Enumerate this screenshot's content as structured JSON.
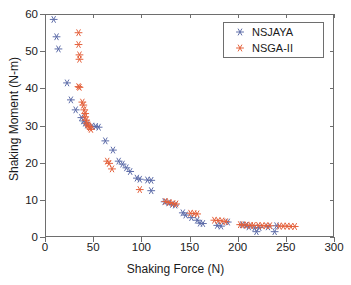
{
  "chart_data": {
    "type": "scatter",
    "title": "",
    "xlabel": "Shaking Force (N)",
    "ylabel": "Shaking Moment (N-m)",
    "xlim": [
      0,
      300
    ],
    "ylim": [
      0,
      60
    ],
    "xticks": [
      0,
      50,
      100,
      150,
      200,
      250,
      300
    ],
    "yticks": [
      0,
      10,
      20,
      30,
      40,
      50,
      60
    ],
    "grid": false,
    "legend_position": "upper right",
    "marker": "asterisk",
    "series": [
      {
        "name": "NSJAYA",
        "color": "#5d6ca8",
        "points": [
          [
            8,
            58.8
          ],
          [
            11,
            54.1
          ],
          [
            13,
            50.8
          ],
          [
            22,
            41.6
          ],
          [
            26,
            37.0
          ],
          [
            31,
            34.3
          ],
          [
            37,
            32.2
          ],
          [
            39,
            31.3
          ],
          [
            41,
            30.7
          ],
          [
            43,
            30.2
          ],
          [
            48,
            29.9
          ],
          [
            52,
            29.8
          ],
          [
            55,
            29.6
          ],
          [
            62,
            25.9
          ],
          [
            70,
            23.4
          ],
          [
            76,
            20.4
          ],
          [
            80,
            19.6
          ],
          [
            84,
            18.6
          ],
          [
            88,
            17.6
          ],
          [
            95,
            15.8
          ],
          [
            98,
            15.5
          ],
          [
            106,
            15.3
          ],
          [
            110,
            15.2
          ],
          [
            110,
            12.4
          ],
          [
            124,
            9.4
          ],
          [
            128,
            9.1
          ],
          [
            132,
            8.7
          ],
          [
            135,
            8.5
          ],
          [
            143,
            6.4
          ],
          [
            146,
            5.8
          ],
          [
            152,
            5.1
          ],
          [
            158,
            4.4
          ],
          [
            161,
            3.6
          ],
          [
            164,
            3.5
          ],
          [
            179,
            3.0
          ],
          [
            183,
            2.8
          ],
          [
            190,
            3.9
          ],
          [
            205,
            3.2
          ],
          [
            209,
            3.0
          ],
          [
            212,
            2.6
          ],
          [
            218,
            2.3
          ],
          [
            220,
            1.3
          ],
          [
            223,
            2.4
          ],
          [
            232,
            2.6
          ],
          [
            239,
            1.3
          ],
          [
            241,
            2.9
          ]
        ]
      },
      {
        "name": "NSGA-II",
        "color": "#e4613b",
        "points": [
          [
            34,
            55.2
          ],
          [
            34,
            52.0
          ],
          [
            35,
            49.2
          ],
          [
            35,
            48.0
          ],
          [
            34,
            40.6
          ],
          [
            35,
            40.4
          ],
          [
            38,
            36.4
          ],
          [
            39,
            35.6
          ],
          [
            40,
            34.3
          ],
          [
            41,
            33.3
          ],
          [
            41,
            32.4
          ],
          [
            42,
            31.5
          ],
          [
            43,
            30.7
          ],
          [
            44,
            30.2
          ],
          [
            45,
            29.8
          ],
          [
            46,
            29.4
          ],
          [
            47,
            29.0
          ],
          [
            64,
            20.4
          ],
          [
            66,
            19.8
          ],
          [
            69,
            18.3
          ],
          [
            98,
            12.7
          ],
          [
            125,
            9.5
          ],
          [
            129,
            9.2
          ],
          [
            133,
            8.9
          ],
          [
            136,
            8.8
          ],
          [
            151,
            6.3
          ],
          [
            155,
            6.2
          ],
          [
            158,
            6.1
          ],
          [
            176,
            4.4
          ],
          [
            180,
            4.3
          ],
          [
            184,
            4.2
          ],
          [
            188,
            4.0
          ],
          [
            203,
            3.2
          ],
          [
            206,
            3.1
          ],
          [
            210,
            3.1
          ],
          [
            214,
            3.0
          ],
          [
            217,
            3.0
          ],
          [
            222,
            3.0
          ],
          [
            226,
            2.9
          ],
          [
            230,
            2.9
          ],
          [
            234,
            2.9
          ],
          [
            244,
            2.8
          ],
          [
            248,
            2.8
          ],
          [
            252,
            2.8
          ],
          [
            256,
            2.7
          ],
          [
            260,
            2.7
          ]
        ]
      }
    ]
  },
  "legend": {
    "items": [
      {
        "label": "NSJAYA",
        "color": "#5d6ca8"
      },
      {
        "label": "NSGA-II",
        "color": "#e4613b"
      }
    ]
  },
  "axes": {
    "xtick_labels": [
      "0",
      "50",
      "100",
      "150",
      "200",
      "250",
      "300"
    ],
    "ytick_labels": [
      "0",
      "10",
      "20",
      "30",
      "40",
      "50",
      "60"
    ]
  }
}
